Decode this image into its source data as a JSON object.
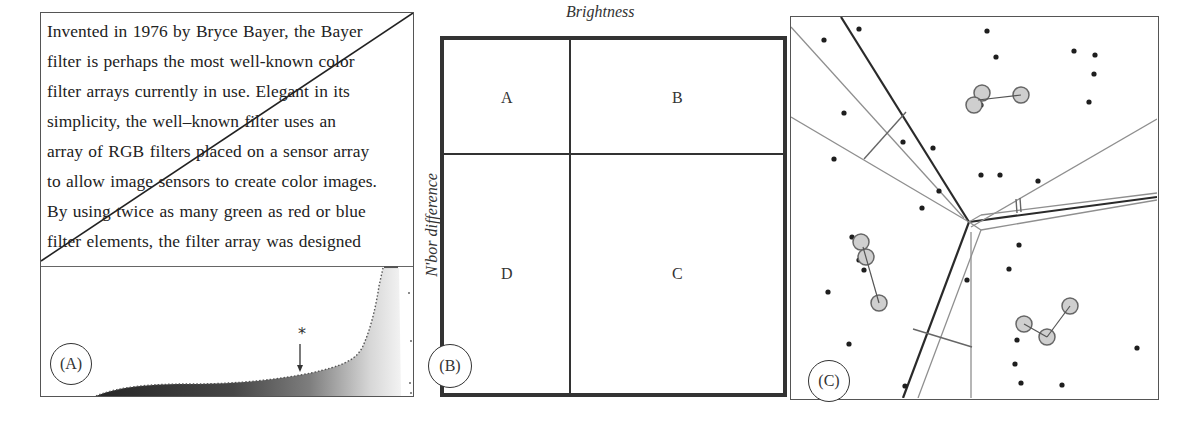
{
  "figure": {
    "panels": [
      {
        "id": "A",
        "label": "(A)",
        "text_lines": [
          "Invented in 1976 by Bryce Bayer, the Bayer",
          "filter is perhaps the most well-known color",
          "filter arrays currently in use. Elegant in its",
          "simplicity, the well–known filter uses an",
          "array of RGB filters placed on a sensor array",
          "to allow image sensors to create color images.",
          "By using twice as many green as red or blue",
          "filter elements, the filter array was designed"
        ],
        "marker": "*",
        "histogram_description": "sorted brightness profile rising sharply at right; arrow marks threshold"
      },
      {
        "id": "B",
        "label": "(B)",
        "x_axis_label": "Brightness",
        "y_axis_label": "N'bor difference",
        "quadrants": {
          "top_left": "A",
          "top_right": "B",
          "bottom_left": "D",
          "bottom_right": "C"
        }
      },
      {
        "id": "C",
        "label": "(C)",
        "description": "Voronoi-style partition with clustered points and linked grey circles"
      }
    ]
  },
  "colors": {
    "ink": "#222222",
    "frame": "#333333",
    "thin_line": "#8a8a8a",
    "circle_fill": "#cfcfcf",
    "dot": "#1e1e1e"
  }
}
